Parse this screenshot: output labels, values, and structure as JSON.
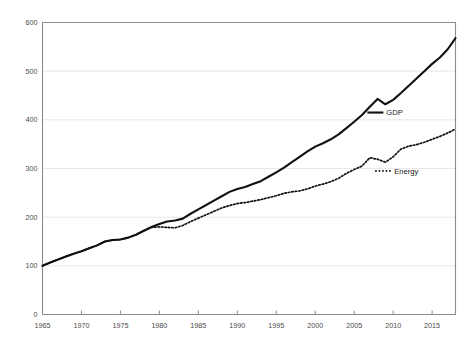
{
  "chart_data": {
    "type": "line",
    "title": "",
    "subtitle": "",
    "xlabel": "",
    "ylabel": "",
    "xlim": [
      1965,
      2018
    ],
    "ylim": [
      0,
      600
    ],
    "grid": true,
    "legend_position": "inline-right",
    "x_ticks": [
      "1965",
      "1970",
      "1975",
      "1980",
      "1985",
      "1990",
      "1995",
      "2000",
      "2005",
      "2010",
      "2015"
    ],
    "x_tick_values": [
      1965,
      1970,
      1975,
      1980,
      1985,
      1990,
      1995,
      2000,
      2005,
      2010,
      2015
    ],
    "y_ticks": [
      "0",
      "100",
      "200",
      "300",
      "400",
      "500",
      "600"
    ],
    "y_tick_values": [
      0,
      100,
      200,
      300,
      400,
      500,
      600
    ],
    "x": [
      1965,
      1966,
      1967,
      1968,
      1969,
      1970,
      1971,
      1972,
      1973,
      1974,
      1975,
      1976,
      1977,
      1978,
      1979,
      1980,
      1981,
      1982,
      1983,
      1984,
      1985,
      1986,
      1987,
      1988,
      1989,
      1990,
      1991,
      1992,
      1993,
      1994,
      1995,
      1996,
      1997,
      1998,
      1999,
      2000,
      2001,
      2002,
      2003,
      2004,
      2005,
      2006,
      2007,
      2008,
      2009,
      2010,
      2011,
      2012,
      2013,
      2014,
      2015,
      2016,
      2017,
      2018
    ],
    "series": [
      {
        "name": "GDP",
        "style": "solid",
        "color": "#111111",
        "values": [
          100,
          107,
          113,
          119,
          125,
          130,
          136,
          142,
          150,
          153,
          154,
          158,
          164,
          172,
          180,
          186,
          191,
          193,
          197,
          207,
          216,
          225,
          234,
          243,
          252,
          258,
          262,
          268,
          274,
          283,
          292,
          302,
          313,
          324,
          335,
          345,
          352,
          360,
          370,
          383,
          396,
          410,
          427,
          443,
          432,
          441,
          455,
          470,
          485,
          500,
          515,
          528,
          545,
          568
        ]
      },
      {
        "name": "Energy",
        "style": "dotted",
        "color": "#111111",
        "values": [
          100,
          107,
          113,
          119,
          125,
          130,
          136,
          142,
          150,
          153,
          154,
          158,
          164,
          172,
          179,
          180,
          179,
          178,
          183,
          191,
          198,
          205,
          212,
          219,
          224,
          228,
          230,
          233,
          236,
          240,
          244,
          249,
          252,
          254,
          258,
          264,
          268,
          273,
          280,
          290,
          298,
          305,
          322,
          319,
          313,
          324,
          340,
          346,
          349,
          354,
          360,
          366,
          373,
          381
        ]
      }
    ],
    "annotations": [
      {
        "text": "GDP",
        "x": 2009,
        "y": 415
      },
      {
        "text": "Energy",
        "x": 2010,
        "y": 295
      }
    ]
  },
  "legend": {
    "gdp_label": "GDP",
    "energy_label": "Energy"
  }
}
